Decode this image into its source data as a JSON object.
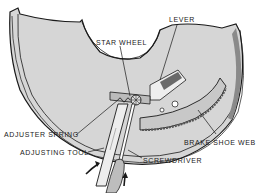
{
  "diagram": {
    "labels": {
      "lever": "LEVER",
      "star_wheel": "STAR WHEEL",
      "adjuster_spring": "ADJUSTER SPRING",
      "adjusting_tool": "ADJUSTING TOOL",
      "screwdriver": "SCREWDRIVER",
      "brake_shoe_web": "BRAKE SHOE WEB"
    },
    "arrows": [
      {
        "name": "push-arrow-left",
        "direction": "up-right"
      },
      {
        "name": "push-arrow-right",
        "direction": "up"
      }
    ],
    "colors": {
      "line": "#1a1a1a",
      "plate_fill": "#d9d9d9",
      "shadow": "#8a8a8a",
      "background": "#ffffff"
    }
  }
}
